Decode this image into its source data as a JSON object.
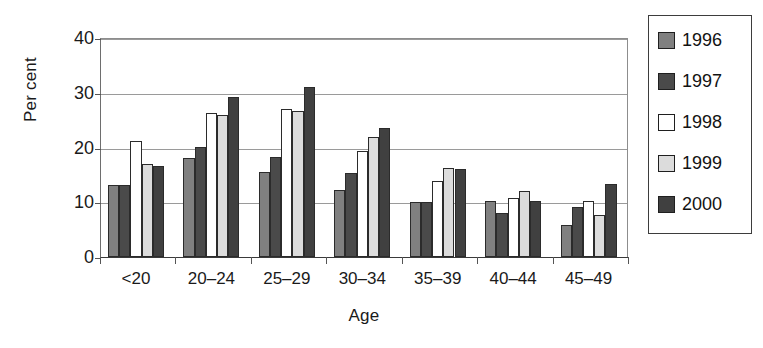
{
  "chart_data": {
    "type": "bar",
    "title": "",
    "subtitle": "",
    "xlabel": "Age",
    "ylabel": "Per cent",
    "categories": [
      "<20",
      "20–24",
      "25–29",
      "30–34",
      "35–39",
      "40–44",
      "45–49"
    ],
    "series": [
      {
        "name": "1996",
        "color": "#808080",
        "values": [
          13.2,
          18.0,
          15.6,
          12.3,
          10.0,
          10.3,
          5.9
        ]
      },
      {
        "name": "1997",
        "color": "#4a4a4a",
        "values": [
          13.2,
          20.1,
          18.3,
          15.4,
          10.0,
          8.1,
          9.2
        ]
      },
      {
        "name": "1998",
        "color": "#ffffff",
        "values": [
          21.2,
          26.3,
          27.0,
          19.3,
          13.8,
          10.7,
          10.3
        ]
      },
      {
        "name": "1999",
        "color": "#dcdcdc",
        "values": [
          17.0,
          26.0,
          26.7,
          22.0,
          16.3,
          12.1,
          7.7
        ]
      },
      {
        "name": "2000",
        "color": "#404040",
        "values": [
          16.6,
          29.3,
          31.0,
          23.6,
          16.0,
          10.3,
          13.3
        ]
      }
    ],
    "ylim": [
      0,
      40
    ],
    "yticks": [
      0,
      10,
      20,
      30,
      40
    ],
    "ytick_labels": [
      "0",
      "10",
      "20",
      "30",
      "40"
    ],
    "grid": "horizontal",
    "legend_position": "right",
    "legend_entries": [
      "1996",
      "1997",
      "1998",
      "1999",
      "2000"
    ]
  },
  "axes": {
    "y_title": "Per cent",
    "x_title": "Age"
  }
}
